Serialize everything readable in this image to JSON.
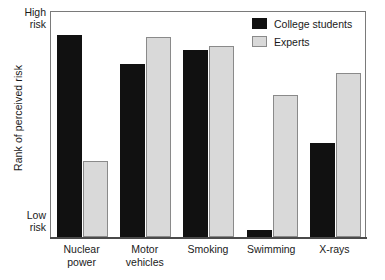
{
  "chart_data": {
    "type": "bar",
    "title": "",
    "xlabel": "",
    "ylabel": "Rank of perceived risk",
    "categories": [
      "Nuclear power",
      "Motor vehicles",
      "Smoking",
      "Swimming",
      "X-rays"
    ],
    "category_lines": [
      [
        "Nuclear",
        "power"
      ],
      [
        "Motor",
        "vehicles"
      ],
      [
        "Smoking"
      ],
      [
        "Swimming"
      ],
      [
        "X-rays"
      ]
    ],
    "series": [
      {
        "name": "College students",
        "color": "#111111",
        "values": [
          90,
          77,
          83,
          3,
          42
        ]
      },
      {
        "name": "Experts",
        "color": "#d9d9d9",
        "values": [
          34,
          89,
          85,
          63,
          73
        ]
      }
    ],
    "ylim": [
      0,
      100
    ],
    "ytick_labels": [
      "High risk",
      "Low risk"
    ],
    "ytick_high_lines": [
      "High",
      "risk"
    ],
    "ytick_low_lines": [
      "Low",
      "risk"
    ],
    "grid": false,
    "legend_position": "top-right",
    "axis_color": "#7a7a7a",
    "experts_border_color": "#8a8a8a"
  },
  "legend": {
    "items": [
      {
        "label": "College students",
        "swatch": "students"
      },
      {
        "label": "Experts",
        "swatch": "experts"
      }
    ]
  }
}
